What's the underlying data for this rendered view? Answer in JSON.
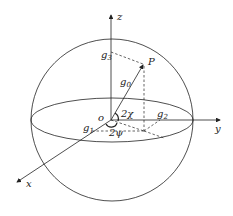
{
  "diagram": {
    "type": "poincare-sphere",
    "axes": {
      "x": "x",
      "y": "y",
      "z": "z"
    },
    "origin": "o",
    "point": "P",
    "vectors": {
      "g0": {
        "base": "g",
        "sub": "0"
      },
      "g1": {
        "base": "g",
        "sub": "1"
      },
      "g2": {
        "base": "g",
        "sub": "2"
      },
      "g3": {
        "base": "g",
        "sub": "3"
      }
    },
    "angles": {
      "chi": "2χ",
      "psi": "2ψ"
    },
    "colors": {
      "line": "#222222",
      "background": "#ffffff"
    }
  }
}
